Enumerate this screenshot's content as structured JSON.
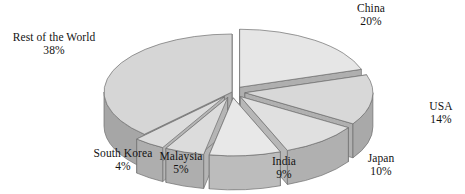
{
  "chart_data": {
    "type": "pie",
    "title": "",
    "subtitle": "",
    "xlabel": "",
    "ylabel": "",
    "style": "3d-exploded",
    "legend_position": "none",
    "grid": false,
    "units": "percent",
    "total": 100,
    "categories": [
      "China",
      "USA",
      "Japan",
      "India",
      "Malaysia",
      "South Korea",
      "Rest of the World"
    ],
    "values": [
      20,
      14,
      10,
      9,
      5,
      4,
      38
    ],
    "slices": [
      {
        "label": "China",
        "value": 20,
        "pct_text": "20%",
        "top_color": "#e6e6e6",
        "side_color": "#b4b4b4",
        "exploded": true
      },
      {
        "label": "USA",
        "value": 14,
        "pct_text": "14%",
        "top_color": "#d8d8d8",
        "side_color": "#a9a9a9",
        "exploded": true
      },
      {
        "label": "Japan",
        "value": 10,
        "pct_text": "10%",
        "top_color": "#e0e0e0",
        "side_color": "#b0b0b0",
        "exploded": true
      },
      {
        "label": "India",
        "value": 9,
        "pct_text": "9%",
        "top_color": "#e8e8e8",
        "side_color": "#bcbcbc",
        "exploded": true
      },
      {
        "label": "Malaysia",
        "value": 5,
        "pct_text": "5%",
        "top_color": "#dcdcdc",
        "side_color": "#aeaeae",
        "exploded": true
      },
      {
        "label": "South Korea",
        "value": 4,
        "pct_text": "4%",
        "top_color": "#dcdcdc",
        "side_color": "#aeaeae",
        "exploded": true
      },
      {
        "label": "Rest of the World",
        "value": 38,
        "pct_text": "38%",
        "top_color": "#d6d6d6",
        "side_color": "#a6a6a6",
        "exploded": false
      }
    ],
    "colors": {
      "background": "#ffffff",
      "text": "#131313",
      "outline": "#6e6e6e",
      "top_face": "#dcdcdc",
      "side_face": "#aaaaaa"
    }
  },
  "labels": {
    "rest_of_world": {
      "name": "Rest of the World",
      "pct": "38%"
    },
    "china": {
      "name": "China",
      "pct": "20%"
    },
    "usa": {
      "name": "USA",
      "pct": "14%"
    },
    "japan": {
      "name": "Japan",
      "pct": "10%"
    },
    "india": {
      "name": "India",
      "pct": "9%"
    },
    "malaysia": {
      "name": "Malaysia",
      "pct": "5%"
    },
    "south_korea": {
      "name": "South Korea",
      "pct": "4%"
    }
  }
}
